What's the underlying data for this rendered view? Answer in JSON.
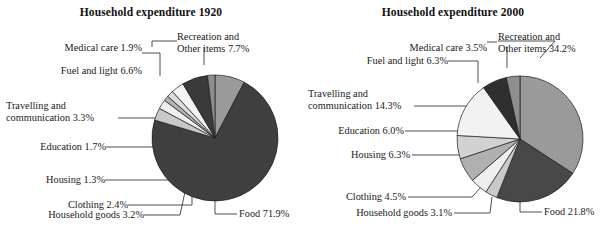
{
  "figure": {
    "background": "#ffffff",
    "text_color": "#1a1a1a"
  },
  "charts": [
    {
      "id": "household-expenditure-1920",
      "title": "Household expenditure 1920",
      "labels": {
        "recreation": "Recreation and",
        "recreation2": "Other items 7.7%",
        "medical": "Medical care 1.9%",
        "fuel": "Fuel and light 6.6%",
        "travelling": "Travelling and",
        "travelling2": "communication 3.3%",
        "education": "Education 1.7%",
        "housing": "Housing 1.3%",
        "clothing": "Clothing 2.4%",
        "household_goods": "Household goods 3.2%",
        "food": "Food 71.9%"
      }
    },
    {
      "id": "household-expenditure-2000",
      "title": "Household expenditure 2000",
      "labels": {
        "recreation": "Recreation and",
        "recreation2": "Other items 34.2%",
        "medical": "Medical care 3.5%",
        "fuel": "Fuel and light 6.3%",
        "travelling": "Travelling and",
        "travelling2": "communication 14.3%",
        "education": "Education 6.0%",
        "housing": "Housing 6.3%",
        "clothing": "Clothing 4.5%",
        "household_goods": "Household goods 3.1%",
        "food": "Food 21.8%"
      }
    }
  ],
  "chart_data": [
    {
      "type": "pie",
      "title": "Household expenditure 1920",
      "unit": "percent",
      "start_angle_deg": 0,
      "direction": "clockwise",
      "categories": [
        "Recreation and Other items",
        "Food",
        "Household goods",
        "Clothing",
        "Housing",
        "Education",
        "Travelling and communication",
        "Fuel and light",
        "Medical care"
      ],
      "values": [
        7.7,
        71.9,
        3.2,
        2.4,
        1.3,
        1.7,
        3.3,
        6.6,
        1.9
      ],
      "colors": [
        "#9a9a9a",
        "#3f3f3f",
        "#c9c9c9",
        "#efefef",
        "#b2b2b2",
        "#dcdcdc",
        "#f3f3f3",
        "#3a3a3a",
        "#8e8e8e"
      ],
      "legend": false,
      "grid": false
    },
    {
      "type": "pie",
      "title": "Household expenditure 2000",
      "unit": "percent",
      "start_angle_deg": 0,
      "direction": "clockwise",
      "categories": [
        "Recreation and Other items",
        "Food",
        "Household goods",
        "Clothing",
        "Housing",
        "Education",
        "Travelling and communication",
        "Fuel and light",
        "Medical care"
      ],
      "values": [
        34.2,
        21.8,
        3.1,
        4.5,
        6.3,
        6.0,
        14.3,
        6.3,
        3.5
      ],
      "colors": [
        "#9a9a9a",
        "#484848",
        "#c9c9c9",
        "#efefef",
        "#b0b0b0",
        "#d2d2d2",
        "#f2f2f2",
        "#2f2f2f",
        "#8e8e8e"
      ],
      "legend": false,
      "grid": false
    }
  ]
}
